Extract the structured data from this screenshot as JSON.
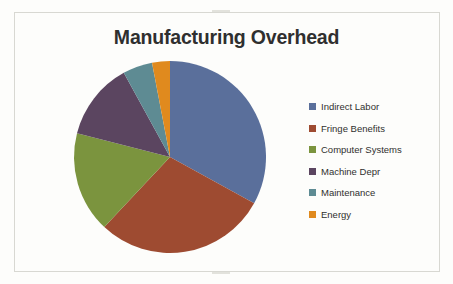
{
  "slide": {
    "title": "Manufacturing Overhead",
    "background_color": "#fdfdfb",
    "frame_color": "#d8d8d2",
    "title_color": "#2f2f2f"
  },
  "legend": {
    "position": "right",
    "items": [
      {
        "label": "Indirect Labor",
        "color": "#5a6f9b"
      },
      {
        "label": "Fringe Benefits",
        "color": "#9e4b31"
      },
      {
        "label": "Computer Systems",
        "color": "#7b943e"
      },
      {
        "label": "Machine Depr",
        "color": "#5b4560"
      },
      {
        "label": "Maintenance",
        "color": "#5e8b93"
      },
      {
        "label": "Energy",
        "color": "#e08a1e"
      }
    ]
  },
  "chart_data": {
    "type": "pie",
    "title": "Manufacturing Overhead",
    "xlabel": "",
    "ylabel": "",
    "legend_position": "right",
    "start_angle_deg": 0,
    "direction": "clockwise",
    "categories": [
      "Indirect Labor",
      "Fringe Benefits",
      "Computer Systems",
      "Machine Depr",
      "Maintenance",
      "Energy"
    ],
    "values": [
      33,
      29,
      17,
      13,
      5,
      3
    ],
    "unit": "percent",
    "colors": [
      "#5a6f9b",
      "#9e4b31",
      "#7b943e",
      "#5b4560",
      "#5e8b93",
      "#e08a1e"
    ],
    "slices": [
      {
        "label": "Indirect Labor",
        "value": 33,
        "color": "#5a6f9b",
        "start_deg": 0,
        "end_deg": 118.8
      },
      {
        "label": "Fringe Benefits",
        "value": 29,
        "color": "#9e4b31",
        "start_deg": 118.8,
        "end_deg": 223.2
      },
      {
        "label": "Computer Systems",
        "value": 17,
        "color": "#7b943e",
        "start_deg": 223.2,
        "end_deg": 284.4
      },
      {
        "label": "Machine Depr",
        "value": 13,
        "color": "#5b4560",
        "start_deg": 284.4,
        "end_deg": 331.2
      },
      {
        "label": "Maintenance",
        "value": 5,
        "color": "#5e8b93",
        "start_deg": 331.2,
        "end_deg": 349.2
      },
      {
        "label": "Energy",
        "value": 3,
        "color": "#e08a1e",
        "start_deg": 349.2,
        "end_deg": 360
      }
    ],
    "data_labels_shown": false,
    "grid": false
  }
}
